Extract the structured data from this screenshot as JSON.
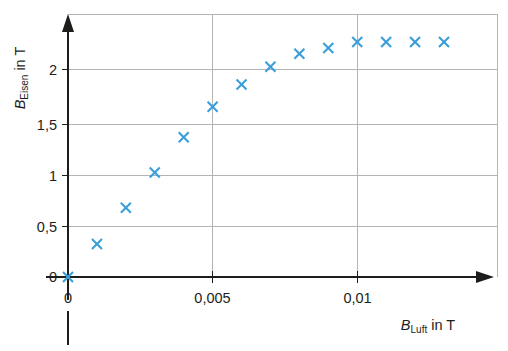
{
  "chart_data": {
    "type": "scatter",
    "title": "",
    "xlabel": "B_Luft in T",
    "ylabel": "B_Eisen in T",
    "xlabel_parts": {
      "var": "B",
      "sub": "Luft",
      "unit": "in T"
    },
    "ylabel_parts": {
      "var": "B",
      "sub": "Eisen",
      "unit": "in T"
    },
    "x": [
      0,
      0.001,
      0.002,
      0.003,
      0.004,
      0.005,
      0.006,
      0.007,
      0.008,
      0.009,
      0.01,
      0.011,
      0.012,
      0.013
    ],
    "values": [
      0,
      0.28,
      0.59,
      0.89,
      1.19,
      1.45,
      1.64,
      1.79,
      1.9,
      1.95,
      2.0,
      2.0,
      2.0,
      2.0
    ],
    "series": [
      {
        "name": "B_Eisen",
        "marker": "x",
        "color": "#3a9fd8",
        "points": [
          {
            "x": 0,
            "y": 0
          },
          {
            "x": 0.001,
            "y": 0.28
          },
          {
            "x": 0.002,
            "y": 0.59
          },
          {
            "x": 0.003,
            "y": 0.89
          },
          {
            "x": 0.004,
            "y": 1.19
          },
          {
            "x": 0.005,
            "y": 1.45
          },
          {
            "x": 0.006,
            "y": 1.64
          },
          {
            "x": 0.007,
            "y": 1.79
          },
          {
            "x": 0.008,
            "y": 1.9
          },
          {
            "x": 0.009,
            "y": 1.95
          },
          {
            "x": 0.01,
            "y": 2.0
          },
          {
            "x": 0.011,
            "y": 2.0
          },
          {
            "x": 0.012,
            "y": 2.0
          },
          {
            "x": 0.013,
            "y": 2.0
          }
        ]
      }
    ],
    "xlim": [
      0,
      0.01485
    ],
    "ylim": [
      0,
      2.235
    ],
    "xticks": [
      {
        "value": 0,
        "label": "0"
      },
      {
        "value": 0.005,
        "label": "0,005"
      },
      {
        "value": 0.01,
        "label": "0,01"
      }
    ],
    "yticks": [
      {
        "value": 0,
        "label": "0"
      },
      {
        "value": 0.5,
        "label": "0,5"
      },
      {
        "value": 1,
        "label": "1"
      },
      {
        "value": 1.5,
        "label": "1,5"
      },
      {
        "value": 2,
        "label": "2"
      }
    ],
    "gridlines_x": [
      0.005,
      0.01
    ],
    "gridlines_y": [
      0.5,
      1,
      1.5,
      2
    ],
    "grid": true,
    "legend": "none",
    "colors": {
      "marker": "#3a9fd8",
      "axis": "#1d1d1b",
      "grid": "#b4b4b4",
      "background": "#ffffff"
    }
  }
}
